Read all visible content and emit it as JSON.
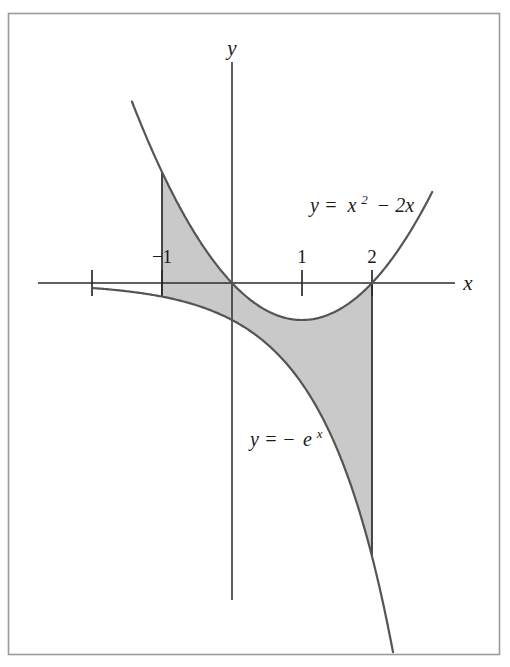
{
  "figure": {
    "kind": "area-between-curves-diagram",
    "background_color": "#ffffff",
    "border_color": "#9a9a9a",
    "frame": {
      "x": 8,
      "y": 13,
      "width": 492,
      "height": 642
    }
  },
  "axes": {
    "x_axis_label": "x",
    "y_axis_label": "y",
    "axis_color": "#2b2b2b",
    "origin_px": {
      "x": 232,
      "y": 283
    },
    "x_scale_px_per_unit": 70,
    "y_scale_px_per_unit": 37,
    "x_axis_span_px": {
      "from": 38,
      "to": 455
    },
    "y_axis_span_px": {
      "from": 62,
      "to": 600
    },
    "x_ticks": [
      {
        "value": -2,
        "label": "",
        "show_label": false
      },
      {
        "value": -1,
        "label": "−1",
        "show_label": true
      },
      {
        "value": 1,
        "label": "1",
        "show_label": true
      },
      {
        "value": 2,
        "label": "2",
        "show_label": true
      }
    ]
  },
  "curves": [
    {
      "id": "parabola",
      "name": "upper-curve",
      "label": "y = x² − 2x",
      "label_parts": {
        "lhs": "y =",
        "base": "x",
        "exponent": "2",
        "rest": "− 2x"
      },
      "color": "#555555",
      "stroke_width": 2.2,
      "domain": [
        -1.43,
        2.86
      ],
      "label_position_px": {
        "x": 310,
        "y": 212
      }
    },
    {
      "id": "neg-exponential",
      "name": "lower-curve",
      "label": "y = −eˣ",
      "label_parts": {
        "lhs": "y = −",
        "base": "e",
        "exponent": "x"
      },
      "color": "#555555",
      "stroke_width": 2.2,
      "domain": [
        -2.0,
        2.3
      ],
      "label_position_px": {
        "x": 250,
        "y": 446
      }
    }
  ],
  "shaded_region": {
    "name": "area-between-curves",
    "fill_color": "#c9c9c9",
    "x_from": -1,
    "x_to": 2,
    "upper_curve": "parabola",
    "lower_curve": "neg-exponential"
  },
  "boundary_segments": [
    {
      "name": "left-boundary",
      "x": -1,
      "from_curve": "parabola",
      "to_curve": "neg-exponential"
    },
    {
      "name": "right-boundary",
      "x": 2,
      "from_curve": "parabola",
      "to_curve": "neg-exponential"
    }
  ],
  "chart_data": {
    "type": "line",
    "title": "",
    "xlabel": "x",
    "ylabel": "y",
    "xlim": [
      -2.6,
      3.2
    ],
    "ylim": [
      -10.5,
      5.8
    ],
    "grid": false,
    "legend": "inline-annotations",
    "series": [
      {
        "name": "y = x² − 2x",
        "expression": "x^2 - 2x",
        "x": [
          -1.43,
          -1.2,
          -1.0,
          -0.75,
          -0.5,
          -0.25,
          0,
          0.5,
          1.0,
          1.5,
          2.0,
          2.4,
          2.86
        ],
        "values": [
          4.9,
          3.84,
          3.0,
          2.06,
          1.25,
          0.56,
          0,
          -0.75,
          -1.0,
          -0.75,
          0,
          0.96,
          2.46
        ]
      },
      {
        "name": "y = −eˣ",
        "expression": "-exp(x)",
        "x": [
          -2.0,
          -1.5,
          -1.0,
          -0.5,
          0,
          0.5,
          1.0,
          1.5,
          2.0,
          2.3
        ],
        "values": [
          -0.135,
          -0.223,
          -0.368,
          -0.607,
          -1.0,
          -1.649,
          -2.718,
          -4.482,
          -7.389,
          -9.974
        ]
      }
    ],
    "shaded_between": {
      "upper": "y = x² − 2x",
      "lower": "y = −eˣ",
      "x_from": -1,
      "x_to": 2
    },
    "annotations": [
      {
        "text": "y = x² − 2x",
        "x": 1.11,
        "y": 1.92
      },
      {
        "text": "y = −eˣ",
        "x": 0.26,
        "y": -4.41
      }
    ]
  }
}
